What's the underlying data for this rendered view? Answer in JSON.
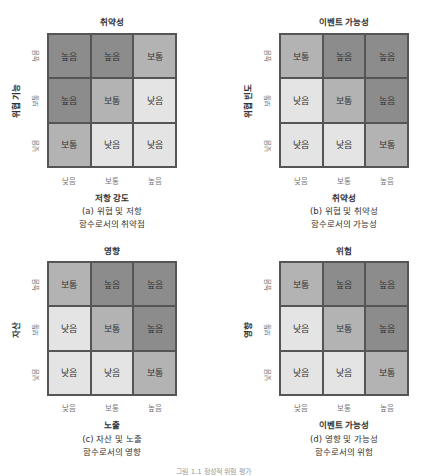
{
  "levels": {
    "high": "높음",
    "medium": "보통",
    "low": "낮음"
  },
  "colors": {
    "high": "#8c8c8c",
    "medium": "#b3b3b3",
    "low": "#e4e4e4",
    "border": "#555555"
  },
  "panels": [
    {
      "id": "a",
      "title": "취약성",
      "ylabel": "위협 기능",
      "yticks": [
        "높음",
        "보통",
        "낮음"
      ],
      "xlabel": "저항 강도",
      "xticks": [
        "낮음",
        "보통",
        "높음"
      ],
      "caption_line1": "(a) 위협 및 저항",
      "caption_line2": "함수로서의 취약점",
      "rows": [
        [
          "높음",
          "높음",
          "보통"
        ],
        [
          "높음",
          "보통",
          "낮음"
        ],
        [
          "보통",
          "낮음",
          "낮음"
        ]
      ]
    },
    {
      "id": "b",
      "title": "이벤트 가능성",
      "ylabel": "위협 빈도",
      "yticks": [
        "높음",
        "보통",
        "낮음"
      ],
      "xlabel": "취약성",
      "xticks": [
        "낮음",
        "보통",
        "높음"
      ],
      "caption_line1": "(b) 위협 및 취약성",
      "caption_line2": "함수로서의 가능성",
      "rows": [
        [
          "보통",
          "높음",
          "높음"
        ],
        [
          "낮음",
          "보통",
          "높음"
        ],
        [
          "낮음",
          "낮음",
          "보통"
        ]
      ]
    },
    {
      "id": "c",
      "title": "영향",
      "ylabel": "자산",
      "yticks": [
        "높음",
        "보통",
        "낮음"
      ],
      "xlabel": "노출",
      "xticks": [
        "낮음",
        "보통",
        "높음"
      ],
      "caption_line1": "(c) 자산 및 노출",
      "caption_line2": "함수로서의 영향",
      "rows": [
        [
          "보통",
          "높음",
          "높음"
        ],
        [
          "낮음",
          "보통",
          "높음"
        ],
        [
          "낮음",
          "낮음",
          "보통"
        ]
      ]
    },
    {
      "id": "d",
      "title": "위험",
      "ylabel": "영향",
      "yticks": [
        "높음",
        "보통",
        "낮음"
      ],
      "xlabel": "이벤트 가능성",
      "xticks": [
        "낮음",
        "보통",
        "높음"
      ],
      "caption_line1": "(d) 영향 및 가능성",
      "caption_line2": "함수로서의 위험",
      "rows": [
        [
          "보통",
          "높음",
          "높음"
        ],
        [
          "낮음",
          "보통",
          "높음"
        ],
        [
          "낮음",
          "낮음",
          "보통"
        ]
      ]
    }
  ],
  "figure_caption": "그림 1.1 정성적 위험 평가"
}
